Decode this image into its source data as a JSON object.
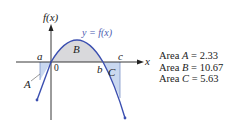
{
  "diagram": {
    "y_axis_label": "f(x)",
    "x_axis_label": "x",
    "curve_label": "y = f(x)",
    "origin_label": "0",
    "points": {
      "a": "a",
      "b": "b",
      "c": "c"
    },
    "regions": {
      "A": "A",
      "B": "B",
      "C": "C"
    },
    "colors": {
      "curve": "#3b4fb0",
      "fill_below": "#c9d8f0",
      "fill_above": "#d9d9dc",
      "axis": "#222222"
    }
  },
  "areas": [
    {
      "label": "Area",
      "region": "A",
      "eq": "=",
      "value": "2.33"
    },
    {
      "label": "Area",
      "region": "B",
      "eq": "=",
      "value": "10.67"
    },
    {
      "label": "Area",
      "region": "C",
      "eq": "=",
      "value": "5.63"
    }
  ]
}
